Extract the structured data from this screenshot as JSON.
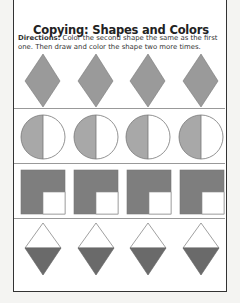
{
  "worksheet": {
    "title": "Copying: Shapes and Colors",
    "directions_label": "Directions:",
    "directions_text": " Color the second shape the same as the first one. Then draw and color the shape two more times."
  },
  "rows": [
    {
      "shape": "diamond",
      "fill": "#9a9a9a",
      "count": 4
    },
    {
      "shape": "half-shaded-circle",
      "fill": "#a8a8a8",
      "count": 4
    },
    {
      "shape": "square-with-white-corner",
      "fill": "#7e7e7e",
      "count": 4
    },
    {
      "shape": "kite-bottom-shaded",
      "fill": "#6a6a6a",
      "count": 4
    }
  ],
  "colors": {
    "page_border": "#333333",
    "divider": "#999999"
  }
}
